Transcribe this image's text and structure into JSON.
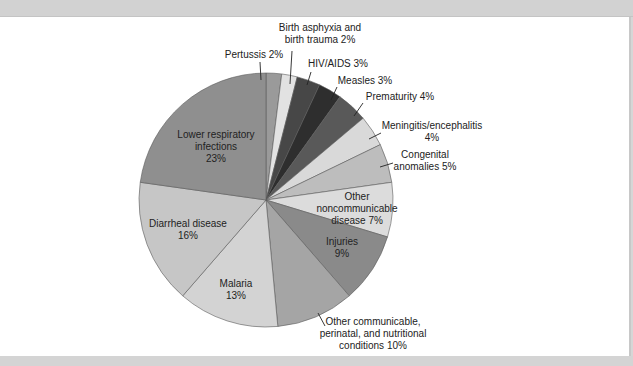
{
  "title_cropped": "",
  "chart_data": {
    "type": "pie",
    "title": "",
    "start_angle_deg": 0,
    "direction": "clockwise",
    "slices": [
      {
        "label": "Pertussis",
        "value": 2,
        "display": "Pertussis 2%",
        "color": "#9a9a9a"
      },
      {
        "label": "Birth asphyxia and birth trauma",
        "value": 2,
        "display": "Birth asphyxia and birth trauma 2%",
        "color": "#e2e2e2"
      },
      {
        "label": "HIV/AIDS",
        "value": 3,
        "display": "HIV/AIDS 3%",
        "color": "#474747"
      },
      {
        "label": "Measles",
        "value": 3,
        "display": "Measles 3%",
        "color": "#2e2e2e"
      },
      {
        "label": "Prematurity",
        "value": 4,
        "display": "Prematurity 4%",
        "color": "#595959"
      },
      {
        "label": "Meningitis/encephalitis",
        "value": 4,
        "display": "Meningitis/encephalitis 4%",
        "color": "#d9d9d9"
      },
      {
        "label": "Congenital anomalies",
        "value": 5,
        "display": "Congenital anomalies 5%",
        "color": "#bdbdbd"
      },
      {
        "label": "Other noncommunicable disease",
        "value": 7,
        "display": "Other noncommunicable disease 7%",
        "color": "#dcdcdc"
      },
      {
        "label": "Injuries",
        "value": 9,
        "display": "Injuries 9%",
        "color": "#8a8a8a"
      },
      {
        "label": "Other communicable, perinatal, and nutritional conditions",
        "value": 10,
        "display": "Other communicable, perinatal, and nutritional conditions 10%",
        "color": "#a5a5a5"
      },
      {
        "label": "Malaria",
        "value": 13,
        "display": "Malaria 13%",
        "color": "#d3d3d3"
      },
      {
        "label": "Diarrheal disease",
        "value": 16,
        "display": "Diarrheal disease 16%",
        "color": "#c6c6c6"
      },
      {
        "label": "Lower respiratory infections",
        "value": 23,
        "display": "Lower respiratory infections 23%",
        "color": "#8f8f8f"
      }
    ],
    "labels": [
      {
        "lines": [
          "Pertussis 2%"
        ],
        "x": 254,
        "y": 58,
        "anchor": "middle",
        "leader": [
          [
            260,
            62
          ],
          [
            261,
            80
          ]
        ]
      },
      {
        "lines": [
          "Birth asphyxia and",
          "birth trauma 2%"
        ],
        "x": 320,
        "y": 31,
        "anchor": "middle",
        "leader": [
          [
            292,
            51
          ],
          [
            290,
            84
          ]
        ]
      },
      {
        "lines": [
          "HIV/AIDS 3%"
        ],
        "x": 338,
        "y": 67,
        "anchor": "middle",
        "leader": [
          [
            311,
            72
          ],
          [
            307,
            85
          ]
        ]
      },
      {
        "lines": [
          "Measles 3%"
        ],
        "x": 365,
        "y": 84,
        "anchor": "middle",
        "leader": [
          [
            337,
            87
          ],
          [
            331,
            100
          ]
        ]
      },
      {
        "lines": [
          "Prematurity 4%"
        ],
        "x": 400,
        "y": 100,
        "anchor": "middle",
        "leader": [
          [
            363,
            103
          ],
          [
            354,
            116
          ]
        ]
      },
      {
        "lines": [
          "Meningitis/encephalitis",
          "4%"
        ],
        "x": 432,
        "y": 129,
        "anchor": "middle",
        "leader": [
          [
            381,
            133
          ],
          [
            369,
            139
          ]
        ]
      },
      {
        "lines": [
          "Congenital",
          "anomalies 5%"
        ],
        "x": 425,
        "y": 158,
        "anchor": "middle",
        "leader": [
          [
            393,
            163
          ],
          [
            380,
            167
          ]
        ]
      },
      {
        "lines": [
          "Other",
          "noncommunicable",
          "disease 7%"
        ],
        "x": 357,
        "y": 200,
        "anchor": "middle",
        "leader": []
      },
      {
        "lines": [
          "Injuries",
          "9%"
        ],
        "x": 342,
        "y": 245,
        "anchor": "middle",
        "leader": []
      },
      {
        "lines": [
          "Other communicable,",
          "perinatal, and nutritional",
          "conditions 10%"
        ],
        "x": 373,
        "y": 325,
        "anchor": "middle",
        "leader": [
          [
            318,
            313
          ],
          [
            325,
            326
          ]
        ]
      },
      {
        "lines": [
          "Malaria",
          "13%"
        ],
        "x": 236,
        "y": 287,
        "anchor": "middle",
        "leader": []
      },
      {
        "lines": [
          "Diarrheal disease",
          "16%"
        ],
        "x": 188,
        "y": 227,
        "anchor": "middle",
        "leader": []
      },
      {
        "lines": [
          "Lower respiratory",
          "infections",
          "23%"
        ],
        "x": 216,
        "y": 138,
        "anchor": "middle",
        "leader": []
      }
    ],
    "geometry": {
      "cx": 266,
      "cy": 200,
      "r": 127
    },
    "legend": "none",
    "grid": false
  }
}
